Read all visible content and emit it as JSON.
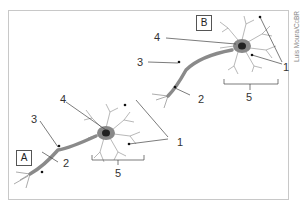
{
  "figure": {
    "neuron_a": {
      "tag": "A",
      "labels": [
        "1",
        "2",
        "3",
        "4",
        "5"
      ]
    },
    "neuron_b": {
      "tag": "B",
      "labels": [
        "1",
        "2",
        "3",
        "4",
        "5"
      ]
    },
    "credit": "Luis Moura/CcBR"
  },
  "labels": {
    "a1": "1",
    "a2": "2",
    "a3": "3",
    "a4": "4",
    "a5": "5",
    "b1": "1",
    "b2": "2",
    "b3": "3",
    "b4": "4",
    "b5": "5"
  }
}
